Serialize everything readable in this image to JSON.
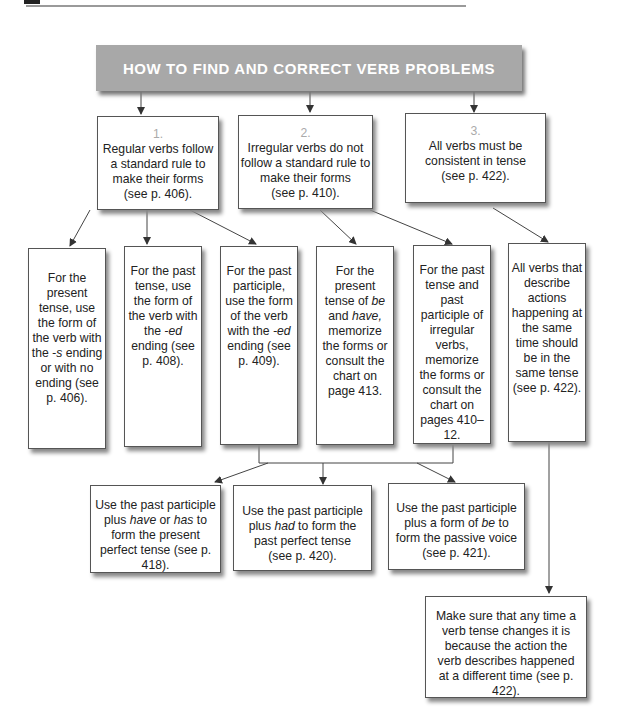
{
  "header": {
    "title": "HOW TO FIND AND CORRECT VERB PROBLEMS"
  },
  "level1": [
    {
      "num": "1.",
      "text": "Regular verbs follow a standard rule to make their forms",
      "ref": "(see p. 406)."
    },
    {
      "num": "2.",
      "text": "Irregular verbs do not follow a standard rule to make their forms",
      "ref": "(see p. 410)."
    },
    {
      "num": "3.",
      "text": "All verbs must be consistent in tense",
      "ref": "(see p. 422)."
    }
  ],
  "level2": [
    {
      "html": "For the present tense, use the form of the verb with the <i>-s</i> ending or with no ending (see p. 406)."
    },
    {
      "html": "For the past tense, use the form of the verb with the <i>-ed</i> ending (see p. 408)."
    },
    {
      "html": "For the past participle, use the form of the verb with the <i>-ed</i> ending (see p. 409)."
    },
    {
      "html": "For the present tense of <i>be</i> and <i>have,</i> memorize the forms or consult the chart on page 413."
    },
    {
      "html": "For the past tense and past participle of irregular verbs, memorize the forms or consult the chart on pages 410–12."
    },
    {
      "html": "All verbs that describe actions happening at the same time should be in the same tense (see p. 422)."
    }
  ],
  "level3": [
    {
      "html": "Use the past participle plus <i>have</i> or <i>has</i> to form the present perfect tense (see p. 418)."
    },
    {
      "html": "Use the past participle plus <i>had</i> to form the past perfect tense (see p. 420)."
    },
    {
      "html": "Use the past participle plus a form of <i>be</i> to form the passive voice (see p. 421)."
    }
  ],
  "level4": {
    "html": "Make sure that any time a verb tense changes it is because the action the verb describes happened at a different time (see p. 422)."
  }
}
